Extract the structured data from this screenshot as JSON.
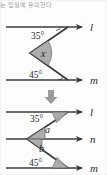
{
  "caption": {
    "text": "지는 입실에 유의한다"
  },
  "colors": {
    "line": "#3b3b3b",
    "wedge_fill": "#a9a9a9",
    "wedge_stroke": "#555555",
    "text": "#1f1f1f",
    "arrow_separator": "#8f8f8f",
    "background": "#fdfdfd"
  },
  "figures": [
    {
      "id": "figure-top",
      "lines": [
        {
          "name": "line-l",
          "label": "l",
          "y": 27
        },
        {
          "name": "line-m",
          "label": "m",
          "y": 80
        }
      ],
      "angles": [
        {
          "name": "angle-35",
          "label": "35°",
          "value": 35,
          "shaded": false,
          "at": "line-l"
        },
        {
          "name": "angle-x",
          "label": "x",
          "value": null,
          "shaded": true,
          "at": "vertex"
        },
        {
          "name": "angle-45",
          "label": "45°",
          "value": 45,
          "shaded": false,
          "at": "line-m"
        }
      ]
    },
    {
      "id": "figure-bottom",
      "lines": [
        {
          "name": "line-l",
          "label": "l",
          "y": 112
        },
        {
          "name": "line-n",
          "label": "n",
          "y": 139
        },
        {
          "name": "line-m",
          "label": "m",
          "y": 168
        }
      ],
      "angles": [
        {
          "name": "angle-35",
          "label": "35°",
          "value": 35,
          "shaded": true,
          "at": "line-l"
        },
        {
          "name": "angle-a",
          "label": "a",
          "value": null,
          "shaded": true,
          "at": "line-n-upper"
        },
        {
          "name": "angle-b",
          "label": "b",
          "value": null,
          "shaded": true,
          "at": "line-n-lower"
        },
        {
          "name": "angle-45",
          "label": "45°",
          "value": 45,
          "shaded": true,
          "at": "line-m"
        }
      ]
    }
  ],
  "separator": {
    "name": "down-arrow-icon",
    "glyph": "↓"
  }
}
